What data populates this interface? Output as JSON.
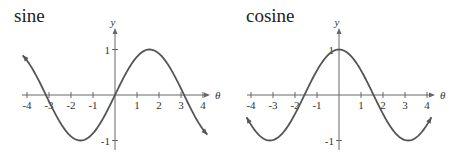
{
  "chart_data": [
    {
      "type": "line",
      "title": "sine",
      "xlabel": "θ",
      "ylabel": "y",
      "xlim": [
        -4,
        4
      ],
      "ylim": [
        -1,
        1
      ],
      "x_ticks": [
        -4,
        -3,
        -2,
        -1,
        1,
        2,
        3,
        4
      ],
      "y_ticks": [
        1,
        -1
      ],
      "function": "sin",
      "plot_range": [
        -4.2,
        4.2
      ],
      "grid": false,
      "series": [
        {
          "name": "sin(θ)",
          "x": [
            -4,
            -3.14,
            -1.57,
            0,
            1.57,
            3.14,
            4
          ],
          "values": [
            0.76,
            0,
            -1,
            0,
            1,
            0,
            -0.76
          ]
        }
      ]
    },
    {
      "type": "line",
      "title": "cosine",
      "xlabel": "θ",
      "ylabel": "y",
      "xlim": [
        -4,
        4
      ],
      "ylim": [
        -1,
        1
      ],
      "x_ticks": [
        -4,
        -3,
        -2,
        -1,
        1,
        2,
        3,
        4
      ],
      "y_ticks": [
        1,
        -1
      ],
      "function": "cos",
      "plot_range": [
        -4.2,
        4.2
      ],
      "grid": false,
      "series": [
        {
          "name": "cos(θ)",
          "x": [
            -4,
            -3.14,
            -1.57,
            0,
            1.57,
            3.14,
            4
          ],
          "values": [
            -0.65,
            -1,
            0,
            1,
            0,
            -1,
            -0.65
          ]
        }
      ]
    }
  ],
  "style": {
    "curve_color": "#555555",
    "axis_color": "#666666",
    "text_color": "#333333"
  }
}
